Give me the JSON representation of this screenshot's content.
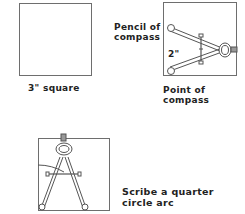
{
  "figures": [
    {
      "id": "square",
      "caption": "3\" square"
    },
    {
      "id": "set-compass",
      "labels": {
        "pencil": "Pencil of",
        "pencil2": "compass",
        "measure": "2\"",
        "point": "Point of",
        "point2": "compass"
      }
    },
    {
      "id": "scribe-arc",
      "caption": "Scribe a quarter",
      "caption2": "circle arc"
    }
  ],
  "colors": {
    "stroke": "#555555",
    "border": "#6e6e6e",
    "text": "#222222"
  }
}
